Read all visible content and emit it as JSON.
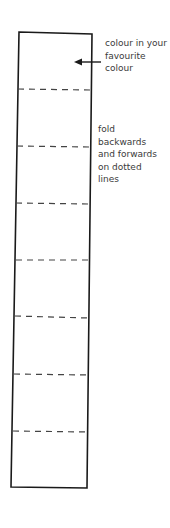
{
  "diagram": {
    "strip": {
      "outline_color": "#1a1a1a",
      "fold_line_color": "#444444",
      "fold_lines_y": [
        89,
        147,
        203,
        260,
        317,
        375,
        432
      ]
    },
    "annotations": {
      "colour_note": {
        "lines": [
          "colour in your",
          "favourite",
          "colour"
        ],
        "arrow": "left-arrow"
      },
      "fold_note": {
        "lines": [
          "fold",
          "backwards",
          "and forwards",
          "on dotted",
          "lines"
        ]
      }
    }
  }
}
